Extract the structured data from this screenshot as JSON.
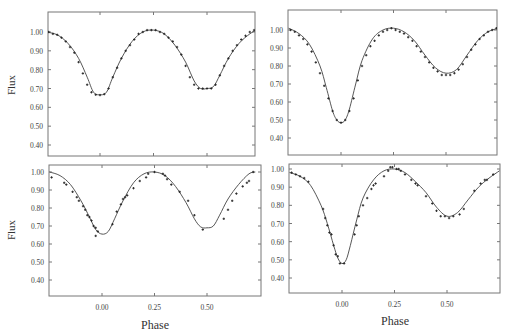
{
  "figure": {
    "xlabel": "Phase",
    "ylabel": "Flux"
  },
  "chart_data": [
    {
      "type": "scatter",
      "panel": "top-left",
      "xlabel": "",
      "ylabel": "Flux",
      "xticks": [
        "0.00",
        "0.25",
        "0.50"
      ],
      "yticks": [
        "1.00",
        "0.90",
        "0.80",
        "0.70",
        "0.60",
        "0.50",
        "0.40"
      ],
      "xlim": [
        -0.25,
        0.73
      ],
      "ylim": [
        0.34,
        1.11
      ],
      "series": [
        {
          "name": "model",
          "kind": "line",
          "x": [
            -0.25,
            -0.2,
            -0.15,
            -0.1,
            -0.06,
            -0.03,
            0.0,
            0.03,
            0.06,
            0.1,
            0.15,
            0.2,
            0.25,
            0.3,
            0.35,
            0.4,
            0.44,
            0.47,
            0.5,
            0.53,
            0.56,
            0.6,
            0.65,
            0.7,
            0.73
          ],
          "y": [
            1.0,
            0.985,
            0.94,
            0.86,
            0.76,
            0.68,
            0.667,
            0.68,
            0.76,
            0.86,
            0.95,
            1.0,
            1.01,
            0.99,
            0.93,
            0.84,
            0.74,
            0.7,
            0.7,
            0.71,
            0.77,
            0.86,
            0.94,
            0.99,
            1.01
          ]
        },
        {
          "name": "observed",
          "kind": "points",
          "x": [
            -0.24,
            -0.22,
            -0.2,
            -0.18,
            -0.16,
            -0.14,
            -0.12,
            -0.1,
            -0.08,
            -0.06,
            -0.04,
            -0.02,
            0.0,
            0.02,
            0.04,
            0.06,
            0.08,
            0.1,
            0.12,
            0.14,
            0.16,
            0.18,
            0.2,
            0.22,
            0.24,
            0.26,
            0.28,
            0.3,
            0.32,
            0.34,
            0.36,
            0.38,
            0.4,
            0.42,
            0.44,
            0.46,
            0.48,
            0.5,
            0.52,
            0.54,
            0.56,
            0.58,
            0.6,
            0.62,
            0.64,
            0.66,
            0.68,
            0.7,
            0.72
          ],
          "y": [
            1.0,
            0.99,
            0.985,
            0.97,
            0.95,
            0.92,
            0.89,
            0.84,
            0.78,
            0.72,
            0.68,
            0.667,
            0.665,
            0.67,
            0.7,
            0.76,
            0.81,
            0.86,
            0.9,
            0.93,
            0.96,
            0.99,
            1.0,
            1.01,
            1.01,
            1.01,
            1.0,
            0.99,
            0.97,
            0.95,
            0.92,
            0.88,
            0.82,
            0.76,
            0.72,
            0.7,
            0.7,
            0.7,
            0.7,
            0.72,
            0.77,
            0.82,
            0.86,
            0.9,
            0.93,
            0.96,
            0.98,
            1.0,
            1.01
          ]
        }
      ]
    },
    {
      "type": "scatter",
      "panel": "top-right",
      "xlabel": "",
      "ylabel": "",
      "xticks": [
        "0.00",
        "0.25",
        "0.50"
      ],
      "yticks": [
        "1.00",
        "0.90",
        "0.80",
        "0.70",
        "0.60",
        "0.50",
        "0.40"
      ],
      "xlim": [
        -0.25,
        0.75
      ],
      "ylim": [
        0.31,
        1.11
      ],
      "series": [
        {
          "name": "model",
          "kind": "line",
          "x": [
            -0.25,
            -0.2,
            -0.15,
            -0.1,
            -0.07,
            -0.04,
            -0.02,
            0.0,
            0.02,
            0.04,
            0.07,
            0.1,
            0.15,
            0.2,
            0.25,
            0.3,
            0.35,
            0.4,
            0.45,
            0.5,
            0.55,
            0.6,
            0.65,
            0.7,
            0.75
          ],
          "y": [
            1.01,
            0.98,
            0.92,
            0.8,
            0.68,
            0.55,
            0.5,
            0.485,
            0.5,
            0.56,
            0.7,
            0.83,
            0.95,
            1.0,
            1.01,
            0.99,
            0.94,
            0.86,
            0.79,
            0.76,
            0.78,
            0.86,
            0.94,
            0.99,
            1.01
          ]
        },
        {
          "name": "observed",
          "kind": "points",
          "x": [
            -0.24,
            -0.22,
            -0.2,
            -0.18,
            -0.16,
            -0.14,
            -0.12,
            -0.1,
            -0.08,
            -0.06,
            -0.04,
            -0.02,
            0.0,
            0.02,
            0.04,
            0.06,
            0.08,
            0.1,
            0.12,
            0.14,
            0.16,
            0.18,
            0.2,
            0.22,
            0.24,
            0.26,
            0.28,
            0.3,
            0.32,
            0.34,
            0.36,
            0.38,
            0.4,
            0.42,
            0.44,
            0.46,
            0.48,
            0.5,
            0.52,
            0.54,
            0.56,
            0.58,
            0.6,
            0.62,
            0.64,
            0.66,
            0.68,
            0.7,
            0.72,
            0.74
          ],
          "y": [
            1.0,
            0.99,
            0.97,
            0.95,
            0.92,
            0.88,
            0.82,
            0.76,
            0.69,
            0.62,
            0.55,
            0.5,
            0.485,
            0.5,
            0.55,
            0.62,
            0.72,
            0.8,
            0.86,
            0.91,
            0.94,
            0.97,
            0.99,
            1.0,
            1.01,
            1.0,
            0.99,
            0.98,
            0.96,
            0.94,
            0.91,
            0.88,
            0.85,
            0.82,
            0.79,
            0.77,
            0.75,
            0.75,
            0.75,
            0.76,
            0.78,
            0.81,
            0.85,
            0.89,
            0.92,
            0.95,
            0.97,
            0.99,
            1.0,
            1.01
          ]
        }
      ]
    },
    {
      "type": "scatter",
      "panel": "bottom-left",
      "xlabel": "Phase",
      "ylabel": "Flux",
      "xticks": [
        "0.00",
        "0.25",
        "0.50"
      ],
      "yticks": [
        "1.00",
        "0.90",
        "0.80",
        "0.70",
        "0.60",
        "0.50",
        "0.40"
      ],
      "xlim": [
        -0.25,
        0.73
      ],
      "ylim": [
        0.31,
        1.05
      ],
      "series": [
        {
          "name": "model",
          "kind": "line",
          "x": [
            -0.25,
            -0.2,
            -0.15,
            -0.1,
            -0.06,
            -0.03,
            0.0,
            0.03,
            0.06,
            0.1,
            0.15,
            0.2,
            0.25,
            0.3,
            0.35,
            0.4,
            0.44,
            0.47,
            0.5,
            0.53,
            0.56,
            0.6,
            0.65,
            0.7,
            0.73
          ],
          "y": [
            1.0,
            0.98,
            0.93,
            0.84,
            0.75,
            0.68,
            0.655,
            0.67,
            0.74,
            0.84,
            0.94,
            0.99,
            1.0,
            0.98,
            0.92,
            0.83,
            0.74,
            0.695,
            0.69,
            0.7,
            0.76,
            0.85,
            0.93,
            0.99,
            1.0
          ]
        },
        {
          "name": "observed",
          "kind": "points",
          "x": [
            -0.24,
            -0.18,
            -0.17,
            -0.14,
            -0.12,
            -0.11,
            -0.09,
            -0.08,
            -0.07,
            -0.06,
            -0.05,
            -0.04,
            -0.03,
            -0.02,
            0.05,
            0.07,
            0.09,
            0.1,
            0.11,
            0.12,
            0.15,
            0.18,
            0.21,
            0.22,
            0.25,
            0.29,
            0.3,
            0.31,
            0.33,
            0.37,
            0.41,
            0.44,
            0.48,
            0.58,
            0.6,
            0.62,
            0.64,
            0.67,
            0.69,
            0.7,
            0.72
          ],
          "y": [
            0.97,
            0.94,
            0.93,
            0.89,
            0.86,
            0.84,
            0.81,
            0.79,
            0.76,
            0.75,
            0.73,
            0.7,
            0.69,
            0.67,
            0.71,
            0.78,
            0.82,
            0.85,
            0.86,
            0.87,
            0.91,
            0.95,
            0.97,
            0.99,
            1.0,
            0.99,
            0.98,
            0.96,
            0.93,
            0.89,
            0.84,
            0.76,
            0.68,
            0.74,
            0.79,
            0.84,
            0.88,
            0.92,
            0.94,
            0.95,
            1.0
          ]
        },
        {
          "name": "outlier",
          "kind": "points",
          "x": [
            -0.03
          ],
          "y": [
            0.645
          ]
        }
      ]
    },
    {
      "type": "scatter",
      "panel": "bottom-right",
      "xlabel": "Phase",
      "ylabel": "",
      "xticks": [
        "0.00",
        "0.25",
        "0.50"
      ],
      "yticks": [
        "1.00",
        "0.90",
        "0.80",
        "0.70",
        "0.60",
        "0.50",
        "0.40"
      ],
      "xlim": [
        -0.25,
        0.75
      ],
      "ylim": [
        0.31,
        1.03
      ],
      "series": [
        {
          "name": "model",
          "kind": "line",
          "x": [
            -0.25,
            -0.2,
            -0.15,
            -0.1,
            -0.07,
            -0.04,
            -0.02,
            0.0,
            0.02,
            0.04,
            0.07,
            0.1,
            0.15,
            0.2,
            0.25,
            0.3,
            0.35,
            0.4,
            0.45,
            0.5,
            0.55,
            0.6,
            0.65,
            0.7,
            0.75
          ],
          "y": [
            0.98,
            0.96,
            0.91,
            0.8,
            0.7,
            0.58,
            0.51,
            0.48,
            0.5,
            0.58,
            0.72,
            0.84,
            0.94,
            0.99,
            1.0,
            0.98,
            0.93,
            0.87,
            0.79,
            0.74,
            0.76,
            0.83,
            0.9,
            0.95,
            0.99
          ]
        },
        {
          "name": "observed",
          "kind": "points",
          "x": [
            -0.24,
            -0.22,
            -0.2,
            -0.18,
            -0.16,
            -0.09,
            -0.08,
            -0.07,
            -0.06,
            -0.05,
            -0.04,
            -0.03,
            -0.02,
            -0.01,
            0.01,
            0.06,
            0.07,
            0.08,
            0.1,
            0.12,
            0.14,
            0.15,
            0.16,
            0.2,
            0.22,
            0.23,
            0.24,
            0.26,
            0.27,
            0.28,
            0.3,
            0.33,
            0.35,
            0.36,
            0.4,
            0.43,
            0.45,
            0.47,
            0.49,
            0.51,
            0.53,
            0.56,
            0.58,
            0.63,
            0.66,
            0.68,
            0.69,
            0.72
          ],
          "y": [
            0.98,
            0.97,
            0.96,
            0.95,
            0.93,
            0.78,
            0.73,
            0.69,
            0.65,
            0.64,
            0.58,
            0.53,
            0.52,
            0.48,
            0.48,
            0.64,
            0.69,
            0.74,
            0.8,
            0.84,
            0.89,
            0.91,
            0.92,
            0.96,
            0.99,
            1.01,
            1.01,
            1.0,
            1.0,
            0.99,
            0.97,
            0.94,
            0.92,
            0.91,
            0.85,
            0.81,
            0.77,
            0.74,
            0.74,
            0.73,
            0.74,
            0.75,
            0.78,
            0.88,
            0.92,
            0.94,
            0.94,
            0.97
          ]
        }
      ]
    }
  ]
}
